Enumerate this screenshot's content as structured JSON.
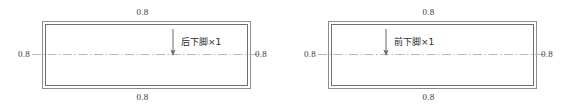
{
  "figure": {
    "background_color": "#ffffff",
    "line_color": "#8d8d8d",
    "text_color": "#3a3a3a"
  },
  "diagrams": [
    {
      "id": "rear-lower-corner",
      "part_label": "后下脚×1",
      "dimensions": {
        "top": "0.8",
        "bottom": "0.8",
        "left": "0.8",
        "right": "0.8"
      },
      "arrow": {
        "direction": "down",
        "position": "right-of-center"
      }
    },
    {
      "id": "front-lower-corner",
      "part_label": "前下脚×1",
      "dimensions": {
        "top": "0.8",
        "bottom": "0.8",
        "left": "0.8",
        "right": "0.8"
      },
      "arrow": {
        "direction": "down",
        "position": "left-of-center"
      }
    }
  ]
}
